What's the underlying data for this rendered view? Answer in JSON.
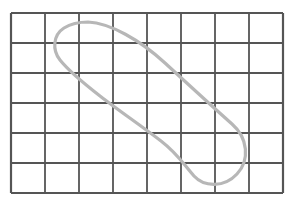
{
  "figure": {
    "background_color": "#ffffff",
    "grid": {
      "name": "rectangular-grid",
      "columns": 8,
      "rows": 6,
      "x_start": 11,
      "y_start": 13,
      "cell_width": 34,
      "cell_height": 30,
      "line_color": "#555555",
      "line_width": 1.8,
      "border_color": "#555555",
      "border_width": 2.2,
      "x_lines": [
        11,
        45,
        79,
        113,
        147,
        181,
        215,
        249,
        283
      ],
      "y_lines": [
        13,
        43,
        73,
        103,
        133,
        163,
        193
      ]
    },
    "curve": {
      "name": "closed-loop-curve",
      "color": "#b7b7b7",
      "line_width": 3.2,
      "closed": true,
      "self_intersecting": true,
      "intersection_point": [
        161,
        141
      ],
      "extrema": {
        "top": [
          88,
          22
        ],
        "left": [
          56,
          52
        ],
        "right": [
          246,
          150
        ],
        "bottom": [
          219,
          184
        ]
      },
      "path": "M 88 22 C 110 23 140 40 165 63 C 190 86 214 108 232 124 C 248 138 250 160 237 174 C 224 188 204 187 194 176 C 184 165 178 154 161 141 C 140 125 118 110 100 96 C 82 82 68 70 60 60 C 52 50 53 35 64 28 C 72 23 80 22 88 22 Z"
    }
  }
}
